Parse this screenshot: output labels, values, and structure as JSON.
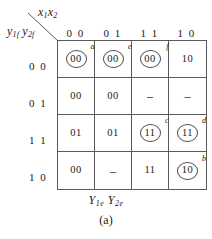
{
  "figure": {
    "caption": "(a)",
    "top_axis_label": "x",
    "top_axis_sub1": "1",
    "top_axis_label2": "x",
    "top_axis_sub2": "2",
    "left_axis_label": "y",
    "left_axis_sub1": "1f",
    "left_axis_label2": "y",
    "left_axis_sub2": "2f",
    "bottom_axis_label": "Y",
    "bottom_axis_sub1": "1e",
    "bottom_axis_label2": "Y",
    "bottom_axis_sub2": "2e"
  },
  "column_headers": [
    "0 0",
    "0 1",
    "1 1",
    "1 0"
  ],
  "row_headers": [
    "0 0",
    "0 1",
    "1 1",
    "1 0"
  ],
  "cells": [
    [
      {
        "value": "00",
        "circled": true,
        "tag": "a"
      },
      {
        "value": "00",
        "circled": true,
        "tag": "e"
      },
      {
        "value": "00",
        "circled": true,
        "tag": "f"
      },
      {
        "value": "10",
        "circled": false,
        "tag": ""
      }
    ],
    [
      {
        "value": "00",
        "circled": false,
        "tag": ""
      },
      {
        "value": "00",
        "circled": false,
        "tag": ""
      },
      {
        "value": "–",
        "circled": false,
        "tag": ""
      },
      {
        "value": "–",
        "circled": false,
        "tag": ""
      }
    ],
    [
      {
        "value": "01",
        "circled": false,
        "tag": ""
      },
      {
        "value": "01",
        "circled": false,
        "tag": ""
      },
      {
        "value": "11",
        "circled": true,
        "tag": "c"
      },
      {
        "value": "11",
        "circled": true,
        "tag": "d"
      }
    ],
    [
      {
        "value": "00",
        "circled": false,
        "tag": ""
      },
      {
        "value": "–",
        "circled": false,
        "tag": ""
      },
      {
        "value": "11",
        "circled": false,
        "tag": ""
      },
      {
        "value": "10",
        "circled": true,
        "tag": "b"
      }
    ]
  ],
  "colors": {
    "grid_line": "#5a5a5a",
    "text": "#1a1a1a",
    "background": "#ffffff"
  }
}
